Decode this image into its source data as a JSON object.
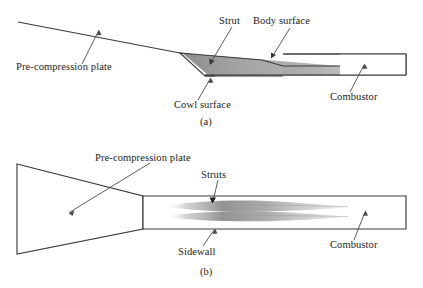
{
  "figure": {
    "background_color": "#ffffff",
    "line_color": "#3a3a3a",
    "text_color": "#1c1c1c",
    "shade_color": "#a8a8a8",
    "shade_color_light": "#c9c9c9"
  },
  "panel_a": {
    "caption": "(a)",
    "labels": {
      "pre_compression_plate": "Pre-compression plate",
      "strut": "Strut",
      "body_surface": "Body surface",
      "cowl_surface": "Cowl surface",
      "combustor": "Combustor"
    }
  },
  "panel_b": {
    "caption": "(b)",
    "labels": {
      "pre_compression_plate": "Pre-compression plate",
      "struts": "Struts",
      "sidewall": "Sidewall",
      "combustor": "Combustor"
    }
  }
}
